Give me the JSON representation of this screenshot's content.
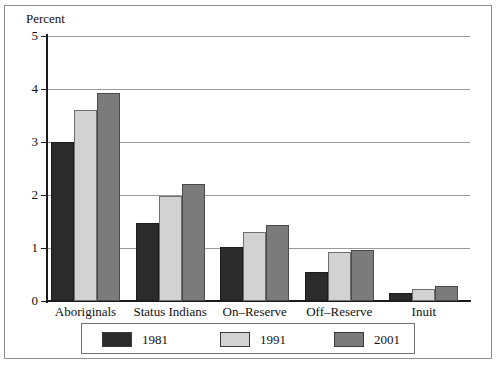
{
  "chart_data": {
    "type": "bar",
    "title": "",
    "subtitle": "",
    "xlabel": "",
    "ylabel": "Percent",
    "ylim": [
      0,
      5
    ],
    "yticks": [
      0,
      1,
      2,
      3,
      4,
      5
    ],
    "ytick_labels": [
      "0",
      "1",
      "2",
      "3",
      "4",
      "5"
    ],
    "grid": "horizontal",
    "legend_position": "bottom",
    "categories": [
      "Aboriginals",
      "Status Indians",
      "On–Reserve",
      "Off–Reserve",
      "Inuit"
    ],
    "series": [
      {
        "name": "1981",
        "color": "#2b2b2b",
        "values": [
          3.0,
          1.48,
          1.02,
          0.55,
          0.15
        ]
      },
      {
        "name": "1991",
        "color": "#d2d2d2",
        "values": [
          3.6,
          1.98,
          1.3,
          0.92,
          0.22
        ]
      },
      {
        "name": "2001",
        "color": "#7b7b7b",
        "values": [
          3.92,
          2.2,
          1.43,
          0.97,
          0.28
        ]
      }
    ]
  },
  "axis": {
    "y_label": "Percent",
    "y_ticks": [
      "5",
      "4",
      "3",
      "2",
      "1",
      "0"
    ]
  },
  "legend": {
    "items": [
      {
        "label": "1981",
        "color": "#2b2b2b"
      },
      {
        "label": "1991",
        "color": "#d2d2d2"
      },
      {
        "label": "2001",
        "color": "#7b7b7b"
      }
    ]
  }
}
